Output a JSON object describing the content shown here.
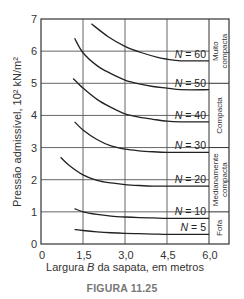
{
  "chart_data": {
    "type": "line",
    "title": "",
    "xlabel": "Largura B da sapata, em metros",
    "xlabel_parts": [
      "Largura ",
      "B",
      " da sapata, em metros"
    ],
    "ylabel": "Pressão admissível, 10² kN/m²",
    "xlim": [
      0,
      6.0
    ],
    "ylim": [
      0,
      7
    ],
    "x_ticks": [
      "0",
      "1,5",
      "3,0",
      "4,5",
      "6,0"
    ],
    "x_tick_values": [
      0,
      1.5,
      3.0,
      4.5,
      6.0
    ],
    "y_ticks": [
      "0",
      "1",
      "2",
      "3",
      "4",
      "5",
      "6",
      "7"
    ],
    "grid": true,
    "series": [
      {
        "name": "N = 60",
        "x": [
          1.8,
          2.4,
          3.0,
          3.6,
          4.2,
          4.5,
          5.0,
          6.0
        ],
        "y": [
          6.85,
          6.45,
          6.15,
          5.95,
          5.8,
          5.75,
          5.7,
          5.7
        ]
      },
      {
        "name": "N = 50",
        "x": [
          1.2,
          1.5,
          2.0,
          2.5,
          3.0,
          3.5,
          4.0,
          4.5,
          5.0,
          6.0
        ],
        "y": [
          6.4,
          5.95,
          5.55,
          5.3,
          5.1,
          4.98,
          4.9,
          4.85,
          4.8,
          4.8
        ]
      },
      {
        "name": "N = 40",
        "x": [
          1.15,
          1.5,
          2.0,
          2.5,
          3.0,
          3.5,
          4.0,
          4.5,
          5.0,
          6.0
        ],
        "y": [
          5.15,
          4.85,
          4.5,
          4.25,
          4.05,
          3.95,
          3.88,
          3.82,
          3.8,
          3.8
        ]
      },
      {
        "name": "N = 30",
        "x": [
          1.2,
          1.5,
          2.0,
          2.5,
          3.0,
          3.5,
          4.0,
          4.5,
          5.0,
          6.0
        ],
        "y": [
          3.8,
          3.55,
          3.25,
          3.05,
          2.95,
          2.9,
          2.87,
          2.85,
          2.85,
          2.85
        ]
      },
      {
        "name": "N = 20",
        "x": [
          0.7,
          1.0,
          1.5,
          2.0,
          2.5,
          3.0,
          3.5,
          4.0,
          4.5,
          5.0,
          6.0
        ],
        "y": [
          2.7,
          2.45,
          2.15,
          1.98,
          1.9,
          1.85,
          1.82,
          1.8,
          1.8,
          1.8,
          1.8
        ]
      },
      {
        "name": "N = 10",
        "x": [
          1.2,
          1.5,
          2.0,
          2.5,
          3.0,
          3.5,
          4.0,
          4.5,
          5.0,
          6.0
        ],
        "y": [
          1.1,
          1.0,
          0.92,
          0.87,
          0.84,
          0.82,
          0.81,
          0.8,
          0.8,
          0.8
        ]
      },
      {
        "name": "N = 5",
        "x": [
          1.2,
          1.5,
          2.0,
          2.5,
          3.0,
          3.5,
          4.0,
          4.5,
          5.0,
          6.0
        ],
        "y": [
          0.45,
          0.42,
          0.38,
          0.35,
          0.33,
          0.32,
          0.31,
          0.3,
          0.3,
          0.3
        ]
      }
    ],
    "curve_labels": [
      {
        "text_prefix": "N",
        "text_suffix": " = 60",
        "y": 5.7
      },
      {
        "text_prefix": "N",
        "text_suffix": " = 50",
        "y": 4.8
      },
      {
        "text_prefix": "N",
        "text_suffix": " = 40",
        "y": 3.8
      },
      {
        "text_prefix": "N",
        "text_suffix": " = 30",
        "y": 2.85
      },
      {
        "text_prefix": "N",
        "text_suffix": " = 20",
        "y": 1.8
      },
      {
        "text_prefix": "N",
        "text_suffix": " = 10",
        "y": 0.8
      },
      {
        "text_prefix": "N",
        "text_suffix": " = 5",
        "y": 0.3
      }
    ],
    "density_bands": [
      {
        "label": [
          "Muito",
          "compacta"
        ],
        "y_from": 5.0,
        "y_to": 7.0
      },
      {
        "label": [
          "Compacta"
        ],
        "y_from": 3.0,
        "y_to": 5.0
      },
      {
        "label": [
          "Medianamente",
          "compacta"
        ],
        "y_from": 1.0,
        "y_to": 3.0
      },
      {
        "label": [
          "Fofa"
        ],
        "y_from": 0.0,
        "y_to": 1.0
      }
    ]
  },
  "caption": "FIGURA 11.25"
}
